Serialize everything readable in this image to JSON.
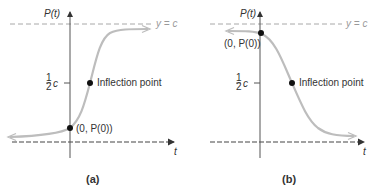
{
  "figure": {
    "panels": [
      {
        "id": "a",
        "caption": "(a)",
        "y_axis_label": "P(t)",
        "x_axis_label": "t",
        "asymptote_label": "y = c",
        "half_c_label_frac": "1/2",
        "half_c_label_c": "c",
        "inflection_label": "Inflection point",
        "intercept_label": "(0, P(0))",
        "curve": "increasing logistic"
      },
      {
        "id": "b",
        "caption": "(b)",
        "y_axis_label": "P(t)",
        "x_axis_label": "t",
        "asymptote_label": "y = c",
        "half_c_label_frac": "1/2",
        "half_c_label_c": "c",
        "inflection_label": "Inflection point",
        "intercept_label": "(0, P(0))",
        "curve": "decreasing logistic"
      }
    ],
    "colors": {
      "curve": "#bdbdbd",
      "axis": "#555555",
      "asymptote": "#a8a8a8",
      "point": "#111111",
      "text": "#333333"
    }
  }
}
